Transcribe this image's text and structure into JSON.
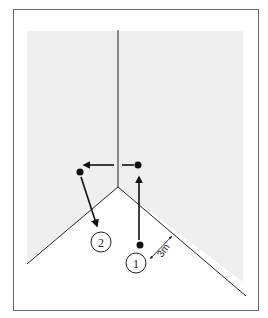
{
  "diagram": {
    "type": "corner-movement-diagram",
    "positions": [
      {
        "id": "1",
        "label": "1"
      },
      {
        "id": "2",
        "label": "2"
      }
    ],
    "distance_label": "3m",
    "colors": {
      "frame": "#6a6a6a",
      "wall_shading": "#eeeeee",
      "line": "#222222",
      "background": "#ffffff"
    }
  }
}
